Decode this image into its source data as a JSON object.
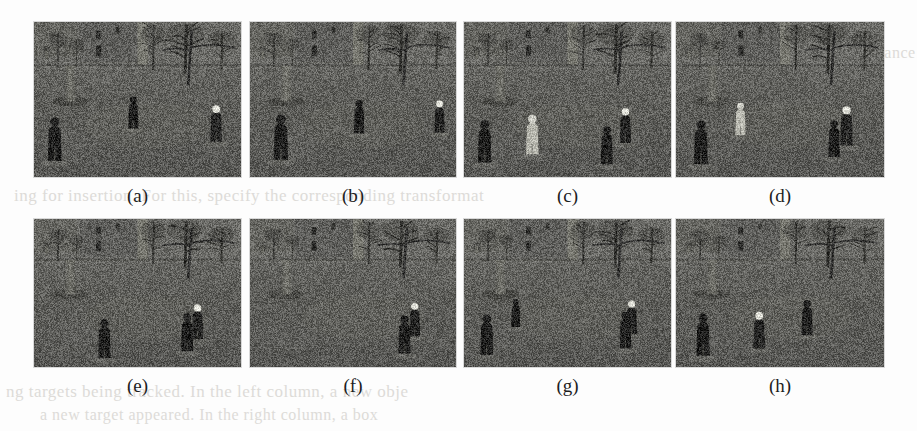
{
  "figure": {
    "kind": "multi-panel-image-grid",
    "rows": 2,
    "cols": 4,
    "paper_color": "#fdfdfd",
    "panel_bg": "#5c5c5c",
    "scene_description": "Outdoor surveillance frames of a grassy churchyard with a stone building, bare trees and gravestones; several pedestrians walk across the lawn.",
    "panels": [
      {
        "id": "a",
        "caption": "(a)",
        "x": 34,
        "y": 22,
        "w": 207,
        "h": 155,
        "people": [
          {
            "x": 0.1,
            "y": 0.62,
            "h": 0.3,
            "tone": "dark"
          },
          {
            "x": 0.48,
            "y": 0.38,
            "h": 0.22,
            "tone": "dark"
          },
          {
            "x": 0.88,
            "y": 0.48,
            "h": 0.25,
            "tone": "light-head"
          }
        ]
      },
      {
        "id": "b",
        "caption": "(b)",
        "x": 250,
        "y": 22,
        "w": 206,
        "h": 155,
        "people": [
          {
            "x": 0.15,
            "y": 0.6,
            "h": 0.31,
            "tone": "dark"
          },
          {
            "x": 0.53,
            "y": 0.42,
            "h": 0.23,
            "tone": "dark"
          },
          {
            "x": 0.92,
            "y": 0.42,
            "h": 0.22,
            "tone": "light-head"
          }
        ]
      },
      {
        "id": "c",
        "caption": "(c)",
        "x": 464,
        "y": 22,
        "w": 207,
        "h": 155,
        "people": [
          {
            "x": 0.1,
            "y": 0.64,
            "h": 0.29,
            "tone": "dark"
          },
          {
            "x": 0.33,
            "y": 0.58,
            "h": 0.27,
            "tone": "light"
          },
          {
            "x": 0.78,
            "y": 0.5,
            "h": 0.24,
            "tone": "light-head"
          },
          {
            "x": 0.69,
            "y": 0.68,
            "h": 0.26,
            "tone": "dark"
          }
        ]
      },
      {
        "id": "d",
        "caption": "(d)",
        "x": 676,
        "y": 22,
        "w": 208,
        "h": 155,
        "people": [
          {
            "x": 0.12,
            "y": 0.65,
            "h": 0.3,
            "tone": "dark"
          },
          {
            "x": 0.31,
            "y": 0.44,
            "h": 0.22,
            "tone": "light"
          },
          {
            "x": 0.82,
            "y": 0.5,
            "h": 0.27,
            "tone": "light-head"
          },
          {
            "x": 0.76,
            "y": 0.62,
            "h": 0.25,
            "tone": "dark"
          }
        ]
      },
      {
        "id": "e",
        "caption": "(e)",
        "x": 34,
        "y": 219,
        "w": 207,
        "h": 148,
        "people": [
          {
            "x": 0.34,
            "y": 0.7,
            "h": 0.28,
            "tone": "dark"
          },
          {
            "x": 0.79,
            "y": 0.54,
            "h": 0.25,
            "tone": "light-head"
          },
          {
            "x": 0.74,
            "y": 0.64,
            "h": 0.27,
            "tone": "dark"
          }
        ]
      },
      {
        "id": "f",
        "caption": "(f)",
        "x": 250,
        "y": 219,
        "w": 206,
        "h": 148,
        "people": [
          {
            "x": 0.8,
            "y": 0.52,
            "h": 0.24,
            "tone": "light-head"
          },
          {
            "x": 0.75,
            "y": 0.66,
            "h": 0.27,
            "tone": "dark"
          }
        ]
      },
      {
        "id": "g",
        "caption": "(g)",
        "x": 464,
        "y": 219,
        "w": 207,
        "h": 148,
        "people": [
          {
            "x": 0.11,
            "y": 0.66,
            "h": 0.29,
            "tone": "dark"
          },
          {
            "x": 0.25,
            "y": 0.46,
            "h": 0.2,
            "tone": "dark"
          },
          {
            "x": 0.81,
            "y": 0.5,
            "h": 0.24,
            "tone": "light-head"
          },
          {
            "x": 0.78,
            "y": 0.62,
            "h": 0.26,
            "tone": "dark"
          }
        ]
      },
      {
        "id": "h",
        "caption": "(h)",
        "x": 676,
        "y": 219,
        "w": 208,
        "h": 148,
        "people": [
          {
            "x": 0.13,
            "y": 0.66,
            "h": 0.3,
            "tone": "dark"
          },
          {
            "x": 0.4,
            "y": 0.62,
            "h": 0.26,
            "tone": "light-head"
          },
          {
            "x": 0.63,
            "y": 0.5,
            "h": 0.25,
            "tone": "dark"
          }
        ]
      }
    ]
  },
  "bleedthrough": [
    {
      "text": "ing for insertion. For this, specify the corresponding transformat",
      "x": 14,
      "y": 186,
      "size": 17
    },
    {
      "text": "is  showing  tracking  performance",
      "x": 690,
      "y": 44,
      "size": 16
    },
    {
      "text": "ti",
      "x": 760,
      "y": 96,
      "size": 16
    },
    {
      "text": "ion",
      "x": 712,
      "y": 120,
      "size": 16
    },
    {
      "text": "o",
      "x": 742,
      "y": 152,
      "size": 16
    },
    {
      "text": "ng  targets  being  tracked.  In  the  left  column,  a  new  obje",
      "x": 6,
      "y": 382,
      "size": 17
    },
    {
      "text": "a  new  target  appeared.  In  the  right  column,  a  box",
      "x": 40,
      "y": 406,
      "size": 16
    }
  ]
}
